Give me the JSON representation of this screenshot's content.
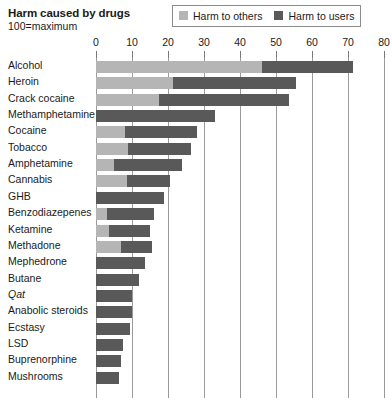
{
  "header": {
    "title": "Harm caused by drugs",
    "subtitle": "100=maximum"
  },
  "legend": {
    "entries": [
      {
        "label": "Harm to others",
        "color": "#b5b5b5",
        "swatch_name": "legend-swatch-harm-to-others"
      },
      {
        "label": "Harm to users",
        "color": "#595959",
        "swatch_name": "legend-swatch-harm-to-users"
      }
    ]
  },
  "chart_data": {
    "type": "bar",
    "orientation": "horizontal",
    "stacked": true,
    "title": "Harm caused by drugs",
    "subtitle": "100=maximum",
    "xlabel": "",
    "ylabel": "",
    "xlim": [
      0,
      80
    ],
    "xticks": [
      0,
      10,
      20,
      30,
      40,
      50,
      60,
      70,
      80
    ],
    "grid": true,
    "legend_position": "top-right",
    "categories": [
      "Alcohol",
      "Heroin",
      "Crack cocaine",
      "Methamphetamine",
      "Cocaine",
      "Tobacco",
      "Amphetamine",
      "Cannabis",
      "GHB",
      "Benzodiazepenes",
      "Ketamine",
      "Methadone",
      "Mephedrone",
      "Butane",
      "Qat",
      "Anabolic steroids",
      "Ecstasy",
      "LSD",
      "Buprenorphine",
      "Mushrooms"
    ],
    "italic_categories": [
      "Qat"
    ],
    "series": [
      {
        "name": "Harm to others",
        "color": "#b5b5b5",
        "values": [
          46,
          21.5,
          17.5,
          0,
          8,
          9,
          5,
          8.5,
          0,
          3,
          3.5,
          7,
          0,
          0,
          0,
          0,
          0,
          0,
          0,
          0
        ]
      },
      {
        "name": "Harm to users",
        "color": "#595959",
        "values": [
          25.5,
          34,
          36,
          33,
          20,
          17.5,
          19,
          12,
          19,
          13,
          11.5,
          8.5,
          13.5,
          12,
          10,
          10,
          9.5,
          7.5,
          7,
          6.5
        ]
      }
    ],
    "totals": [
      71.5,
      55.5,
      53.5,
      33,
      28,
      26.5,
      24,
      20.5,
      19,
      16,
      15,
      15.5,
      13.5,
      12,
      10,
      10,
      9.5,
      7.5,
      7,
      6.5
    ]
  }
}
